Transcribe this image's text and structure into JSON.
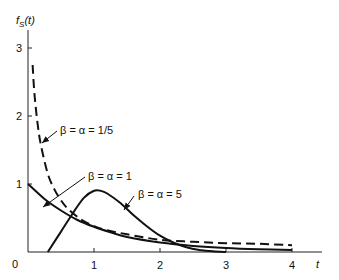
{
  "chart_data": {
    "type": "line",
    "title": "",
    "xlabel": "t",
    "ylabel": "f_S(t)",
    "xlim": [
      0,
      4.4
    ],
    "ylim": [
      0,
      3.3
    ],
    "x_ticks": [
      "0",
      "1",
      "2",
      "3",
      "4"
    ],
    "y_ticks": [
      "1",
      "2",
      "3"
    ],
    "grid": false,
    "legend": "inline annotations with arrows",
    "series": [
      {
        "name": "β = α = 1/5",
        "style": "dashed",
        "x": [
          0.07,
          0.1,
          0.15,
          0.2,
          0.3,
          0.4,
          0.5,
          0.6,
          0.8,
          1.0,
          1.2,
          1.5,
          2.0,
          2.5,
          3.0,
          3.5,
          4.0
        ],
        "values": [
          2.75,
          2.3,
          1.85,
          1.55,
          1.15,
          0.92,
          0.76,
          0.64,
          0.48,
          0.38,
          0.32,
          0.26,
          0.18,
          0.15,
          0.13,
          0.12,
          0.1
        ]
      },
      {
        "name": "β = α = 1",
        "style": "solid",
        "x": [
          0,
          0.25,
          0.5,
          0.75,
          1.0,
          1.25,
          1.5,
          2.0,
          2.5,
          3.0,
          3.5,
          4.0
        ],
        "values": [
          1.0,
          0.78,
          0.61,
          0.47,
          0.37,
          0.29,
          0.22,
          0.14,
          0.09,
          0.06,
          0.04,
          0.03
        ]
      },
      {
        "name": "β = α = 5",
        "style": "solid",
        "x": [
          0.3,
          0.5,
          0.7,
          0.85,
          1.0,
          1.1,
          1.2,
          1.4,
          1.6,
          1.8,
          2.0,
          2.2,
          2.4,
          2.6,
          2.8,
          3.0
        ],
        "values": [
          0.0,
          0.3,
          0.6,
          0.8,
          0.9,
          0.9,
          0.86,
          0.72,
          0.54,
          0.38,
          0.24,
          0.14,
          0.07,
          0.03,
          0.01,
          0.0
        ]
      }
    ],
    "annotations": [
      {
        "text": "β = α = 1/5",
        "points_to_series": 0
      },
      {
        "text": "β = α = 1",
        "points_to_series": 1
      },
      {
        "text": "β = α = 5",
        "points_to_series": 2
      }
    ]
  },
  "axes": {
    "y_label": "f",
    "y_label_sub": "S",
    "y_label_arg": "(t)",
    "x_label": "t",
    "origin_label": "0"
  }
}
